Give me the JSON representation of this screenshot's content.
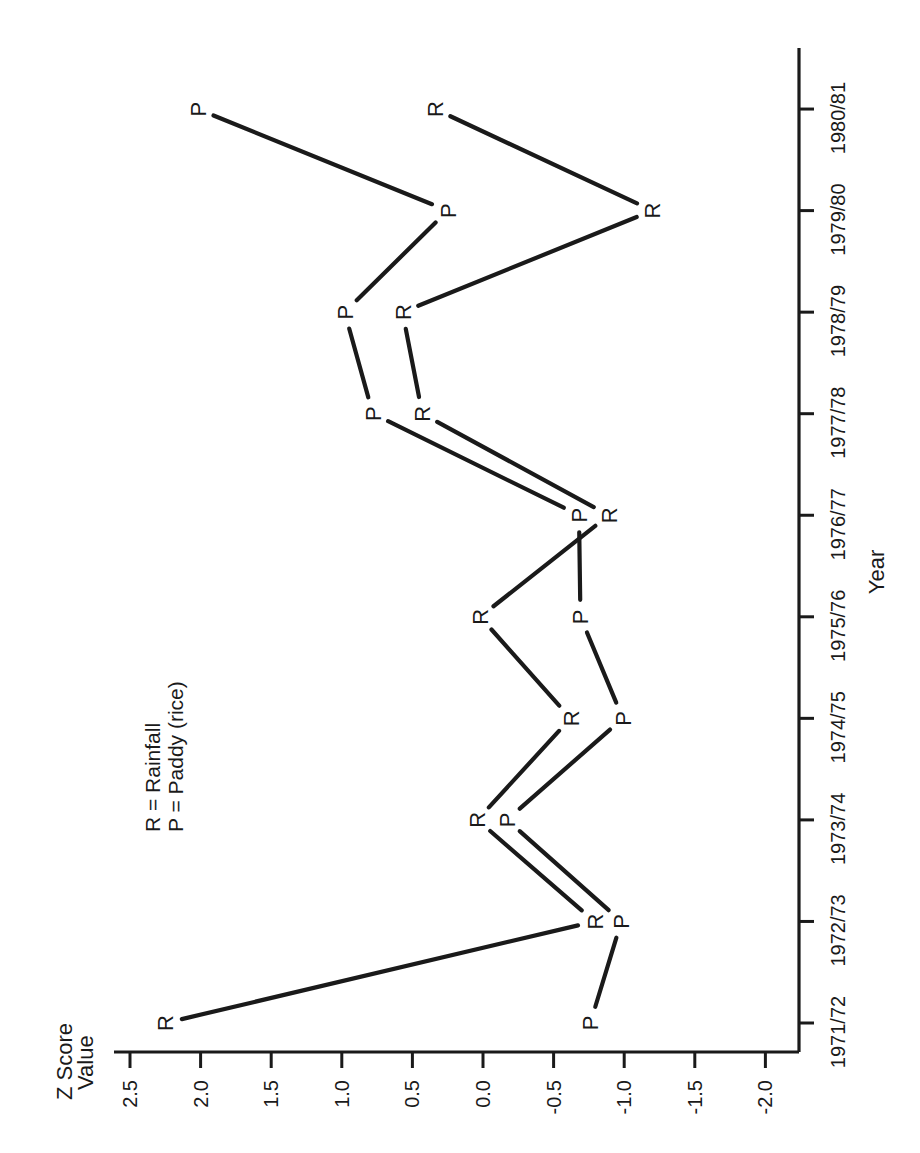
{
  "chart_data": {
    "type": "line",
    "orientation": "rotated-90-ccw",
    "title": "",
    "xlabel": "Year",
    "ylabel": "Z Score Value",
    "ylabel_lines": [
      "Z Score",
      "Value"
    ],
    "categories": [
      "1971/72",
      "1972/73",
      "1973/74",
      "1974/75",
      "1975/76",
      "1976/77",
      "1977/78",
      "1978/79",
      "1979/80",
      "1980/81"
    ],
    "series": [
      {
        "name": "Rainfall",
        "marker": "R",
        "values": [
          2.25,
          -0.79,
          0.04,
          -0.62,
          0.02,
          -0.89,
          0.43,
          0.57,
          -1.2,
          0.34
        ]
      },
      {
        "name": "Paddy (rice)",
        "marker": "P",
        "values": [
          -0.76,
          -0.98,
          -0.17,
          -0.99,
          -0.69,
          -0.68,
          0.78,
          0.98,
          0.25,
          2.02
        ]
      }
    ],
    "yticks": [
      "2.5",
      "2.0",
      "1.5",
      "1.0",
      "0.5",
      "0.0",
      "-0.5",
      "-1.0",
      "-1.5",
      "-2.0"
    ],
    "ylim": [
      -2.2,
      2.6
    ],
    "grid": false,
    "legend": {
      "position": "upper-left (rotated view)",
      "entries": [
        "R = Rainfall",
        "P = Paddy (rice)"
      ]
    }
  },
  "legend": {
    "line1": "R = Rainfall",
    "line2": "P = Paddy (rice)"
  },
  "axes": {
    "x_title": "Year",
    "y_title_line1": "Z Score",
    "y_title_line2": "Value"
  },
  "colors": {
    "ink": "#1a1a1a",
    "background": "#ffffff"
  }
}
